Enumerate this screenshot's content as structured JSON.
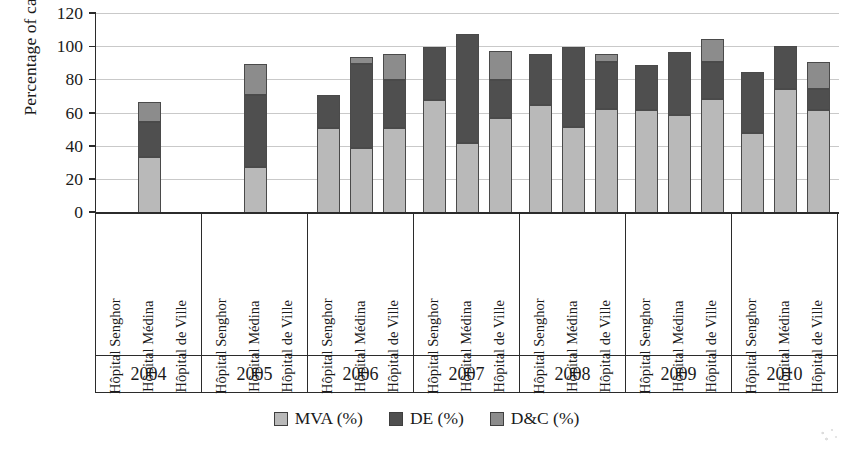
{
  "chart_data": {
    "type": "bar",
    "subtype": "stacked-grouped-bar",
    "title": "",
    "xlabel": "",
    "ylabel": "Percentage of cases (%)",
    "ylim": [
      0,
      120
    ],
    "yticks": [
      0,
      20,
      40,
      60,
      80,
      100,
      120
    ],
    "ytick_labels": [
      "0",
      "20",
      "40",
      "60",
      "80",
      "100",
      "120"
    ],
    "grid": true,
    "legend_position": "bottom-center",
    "categories": [
      "2004",
      "2005",
      "2006",
      "2007",
      "2008",
      "2009",
      "2010"
    ],
    "subcategories": [
      "Hôpital Senghor",
      "Hôpital Médina",
      "Hôpital de Ville"
    ],
    "series": [
      {
        "name": "MVA (%)",
        "color": "#b9b9b9"
      },
      {
        "name": "DE (%)",
        "color": "#4f4f4f"
      },
      {
        "name": "D&C (%)",
        "color": "#8c8c8c"
      }
    ],
    "groups": [
      {
        "year": "2004",
        "bars": [
          {
            "hospital": "Hôpital Senghor",
            "present": false,
            "mva": null,
            "de": null,
            "dc": null,
            "total": null
          },
          {
            "hospital": "Hôpital Médina",
            "present": true,
            "mva": 34,
            "de": 21,
            "dc": 12,
            "total": 67
          },
          {
            "hospital": "Hôpital de Ville",
            "present": false,
            "mva": null,
            "de": null,
            "dc": null,
            "total": null
          }
        ]
      },
      {
        "year": "2005",
        "bars": [
          {
            "hospital": "Hôpital Senghor",
            "present": false,
            "mva": null,
            "de": null,
            "dc": null,
            "total": null
          },
          {
            "hospital": "Hôpital Médina",
            "present": true,
            "mva": 28,
            "de": 43,
            "dc": 19,
            "total": 90
          },
          {
            "hospital": "Hôpital de Ville",
            "present": false,
            "mva": null,
            "de": null,
            "dc": null,
            "total": null
          }
        ]
      },
      {
        "year": "2006",
        "bars": [
          {
            "hospital": "Hôpital Senghor",
            "present": true,
            "mva": 51,
            "de": 20,
            "dc": 0,
            "total": 71
          },
          {
            "hospital": "Hôpital Médina",
            "present": true,
            "mva": 39,
            "de": 51,
            "dc": 4,
            "total": 94
          },
          {
            "hospital": "Hôpital de Ville",
            "present": true,
            "mva": 51,
            "de": 29,
            "dc": 16,
            "total": 96
          }
        ]
      },
      {
        "year": "2007",
        "bars": [
          {
            "hospital": "Hôpital Senghor",
            "present": true,
            "mva": 68,
            "de": 32,
            "dc": 0,
            "total": 100
          },
          {
            "hospital": "Hôpital Médina",
            "present": true,
            "mva": 42,
            "de": 66,
            "dc": 0,
            "total": 108
          },
          {
            "hospital": "Hôpital de Ville",
            "present": true,
            "mva": 57,
            "de": 23,
            "dc": 18,
            "total": 98
          }
        ]
      },
      {
        "year": "2008",
        "bars": [
          {
            "hospital": "Hôpital Senghor",
            "present": true,
            "mva": 65,
            "de": 31,
            "dc": 0,
            "total": 96
          },
          {
            "hospital": "Hôpital Médina",
            "present": true,
            "mva": 52,
            "de": 48,
            "dc": 0,
            "total": 100
          },
          {
            "hospital": "Hôpital de Ville",
            "present": true,
            "mva": 63,
            "de": 28,
            "dc": 5,
            "total": 96
          }
        ]
      },
      {
        "year": "2009",
        "bars": [
          {
            "hospital": "Hôpital Senghor",
            "present": true,
            "mva": 62,
            "de": 27,
            "dc": 0,
            "total": 89
          },
          {
            "hospital": "Hôpital Médina",
            "present": true,
            "mva": 59,
            "de": 38,
            "dc": 0,
            "total": 97
          },
          {
            "hospital": "Hôpital de Ville",
            "present": true,
            "mva": 69,
            "de": 22,
            "dc": 14,
            "total": 105
          }
        ]
      },
      {
        "year": "2010",
        "bars": [
          {
            "hospital": "Hôpital Senghor",
            "present": true,
            "mva": 48,
            "de": 37,
            "dc": 0,
            "total": 85
          },
          {
            "hospital": "Hôpital Médina",
            "present": true,
            "mva": 75,
            "de": 26,
            "dc": 0,
            "total": 101
          },
          {
            "hospital": "Hôpital de Ville",
            "present": true,
            "mva": 62,
            "de": 13,
            "dc": 16,
            "total": 91
          }
        ]
      }
    ]
  },
  "colors": {
    "mva": "#b9b9b9",
    "de": "#4f4f4f",
    "dc": "#8c8c8c",
    "axis": "#2b2b2b",
    "grid": "#c9c9c9",
    "background": "#ffffff"
  }
}
